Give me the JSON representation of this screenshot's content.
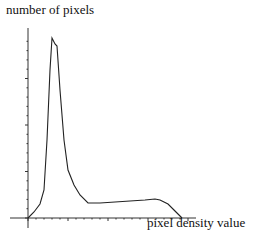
{
  "chart_data": {
    "type": "line",
    "title": "",
    "xlabel": "pixel density value",
    "ylabel": "number of pixels",
    "grid": false,
    "legend": null,
    "x_ticks": "unlabeled minor ticks",
    "y_ticks": "unlabeled minor ticks",
    "series": [
      {
        "name": "histogram",
        "points_px": [
          [
            28,
            218
          ],
          [
            34,
            212
          ],
          [
            40,
            204
          ],
          [
            44,
            190
          ],
          [
            47,
            140
          ],
          [
            50,
            70
          ],
          [
            52,
            38
          ],
          [
            55,
            44
          ],
          [
            57,
            46
          ],
          [
            60,
            90
          ],
          [
            64,
            140
          ],
          [
            68,
            170
          ],
          [
            74,
            185
          ],
          [
            80,
            195
          ],
          [
            88,
            203
          ],
          [
            100,
            203
          ],
          [
            115,
            202
          ],
          [
            130,
            201
          ],
          [
            145,
            200
          ],
          [
            155,
            199
          ],
          [
            160,
            200
          ],
          [
            168,
            204
          ],
          [
            174,
            210
          ],
          [
            178,
            214
          ],
          [
            182,
            218
          ]
        ]
      }
    ]
  },
  "labels": {
    "y_axis": "number of pixels",
    "x_axis": "pixel density value"
  },
  "colors": {
    "line": "#222222",
    "background": "#ffffff"
  }
}
